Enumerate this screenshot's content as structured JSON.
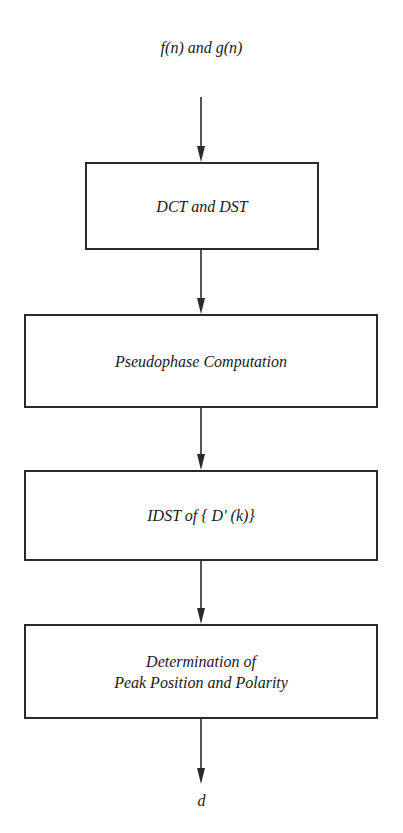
{
  "diagram": {
    "type": "flowchart",
    "direction": "top-to-bottom",
    "input": {
      "label": "f(n) and g(n)"
    },
    "steps": [
      {
        "id": "dct-dst",
        "label": "DCT and DST"
      },
      {
        "id": "pseudophase",
        "label": "Pseudophase Computation"
      },
      {
        "id": "idst",
        "label": "IDST of { D' (k)}"
      },
      {
        "id": "peak",
        "lines": [
          "Determination of",
          "Peak Position and Polarity"
        ]
      }
    ],
    "output": {
      "label": "d"
    },
    "edges": [
      {
        "from": "input",
        "to": "dct-dst"
      },
      {
        "from": "dct-dst",
        "to": "pseudophase"
      },
      {
        "from": "pseudophase",
        "to": "idst"
      },
      {
        "from": "idst",
        "to": "peak"
      },
      {
        "from": "peak",
        "to": "output"
      }
    ]
  },
  "colors": {
    "stroke": "#2a2a2a",
    "text": "#1a1a1a",
    "background": "#ffffff"
  }
}
